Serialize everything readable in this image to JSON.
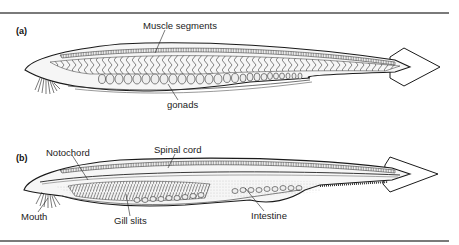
{
  "figure": {
    "panels": [
      {
        "id": "a",
        "label": "(a)",
        "annotations": [
          {
            "text": "Muscle segments",
            "target": "myotomes"
          },
          {
            "text": "gonads",
            "target": "gonad sacs"
          }
        ]
      },
      {
        "id": "b",
        "label": "(b)",
        "annotations": [
          {
            "text": "Notochord",
            "target": "notochord rod"
          },
          {
            "text": "Spinal cord",
            "target": "dorsal nerve cord"
          },
          {
            "text": "Mouth",
            "target": "oral cirri"
          },
          {
            "text": "Gill slits",
            "target": "pharyngeal slits"
          },
          {
            "text": "Intestine",
            "target": "gut"
          }
        ]
      }
    ],
    "colors": {
      "line": "#1a1a1a",
      "rule": "#7a7a7a",
      "fill": "#f4f4f4",
      "stipple": "#bdbdbd"
    }
  }
}
